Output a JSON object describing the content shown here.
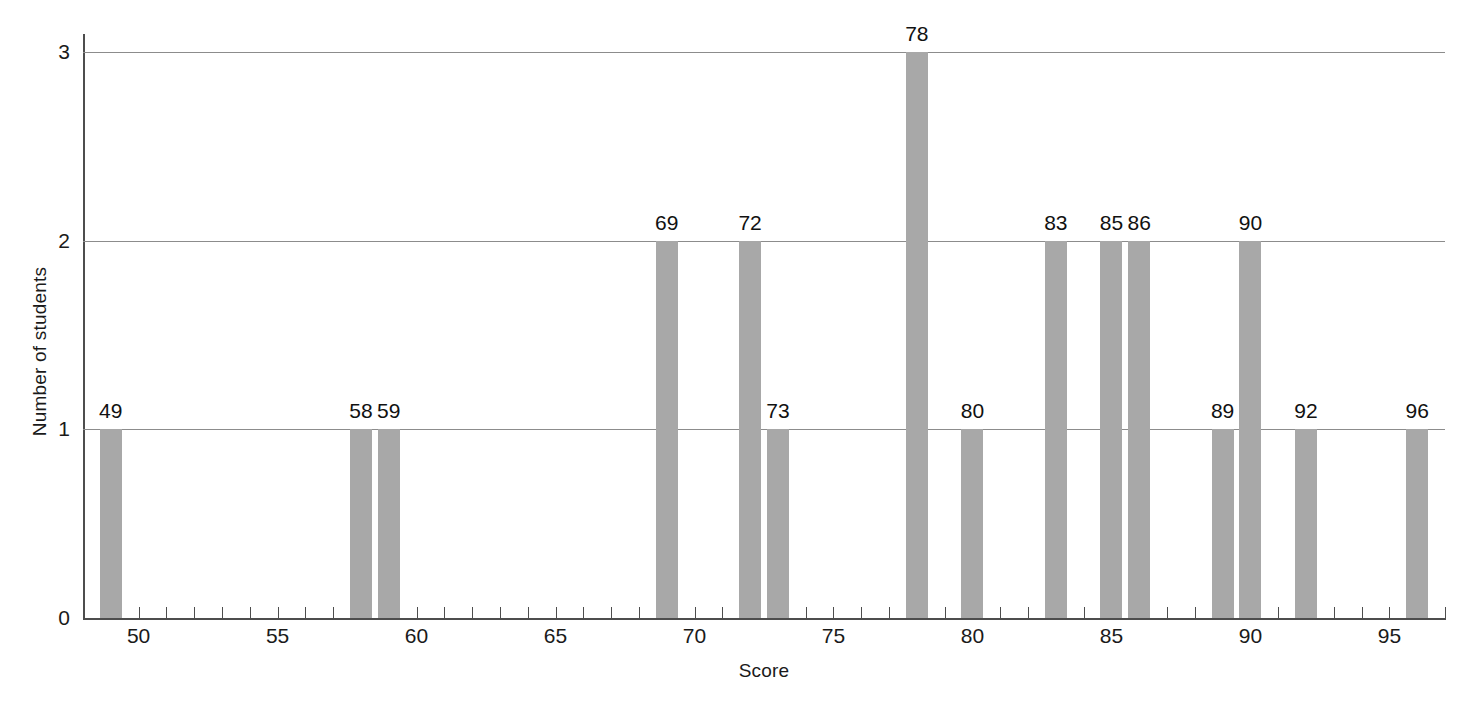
{
  "chart_data": {
    "type": "bar",
    "title": "",
    "subtitle": "",
    "xlabel": "Score",
    "ylabel": "Number of students",
    "xlim": [
      48,
      97
    ],
    "ylim": [
      0,
      3
    ],
    "grid": true,
    "legend": false,
    "bar_color": "#a8a8a8",
    "axis_color": "#4d4d4d",
    "gridline_color": "#8c8c8c",
    "x_tick_step": 1,
    "x_tick_label_step": 5,
    "x_tick_labels": [
      "50",
      "55",
      "60",
      "65",
      "70",
      "75",
      "80",
      "85",
      "90",
      "95"
    ],
    "x_tick_label_values": [
      50,
      55,
      60,
      65,
      70,
      75,
      80,
      85,
      90,
      95
    ],
    "y_tick_labels": [
      "0",
      "1",
      "2",
      "3"
    ],
    "y_tick_values": [
      0,
      1,
      2,
      3
    ],
    "categories": [
      49,
      58,
      59,
      69,
      72,
      73,
      78,
      80,
      83,
      85,
      86,
      89,
      90,
      92,
      96
    ],
    "values": [
      1,
      1,
      1,
      2,
      2,
      1,
      3,
      1,
      2,
      2,
      2,
      1,
      2,
      1,
      1
    ],
    "data_labels": [
      "49",
      "58",
      "59",
      "69",
      "72",
      "73",
      "78",
      "80",
      "83",
      "85",
      "86",
      "89",
      "90",
      "92",
      "96"
    ],
    "bars": [
      {
        "score": 49,
        "count": 1,
        "label": "49"
      },
      {
        "score": 58,
        "count": 1,
        "label": "58"
      },
      {
        "score": 59,
        "count": 1,
        "label": "59"
      },
      {
        "score": 69,
        "count": 2,
        "label": "69"
      },
      {
        "score": 72,
        "count": 2,
        "label": "72"
      },
      {
        "score": 73,
        "count": 1,
        "label": "73"
      },
      {
        "score": 78,
        "count": 3,
        "label": "78"
      },
      {
        "score": 80,
        "count": 1,
        "label": "80"
      },
      {
        "score": 83,
        "count": 2,
        "label": "83"
      },
      {
        "score": 85,
        "count": 2,
        "label": "85"
      },
      {
        "score": 86,
        "count": 2,
        "label": "86"
      },
      {
        "score": 89,
        "count": 1,
        "label": "89"
      },
      {
        "score": 90,
        "count": 2,
        "label": "90"
      },
      {
        "score": 92,
        "count": 1,
        "label": "92"
      },
      {
        "score": 96,
        "count": 1,
        "label": "96"
      }
    ]
  }
}
